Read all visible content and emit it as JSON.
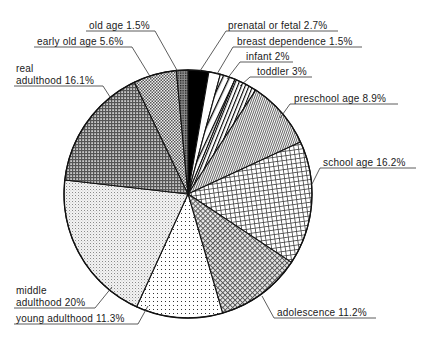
{
  "chart_data": {
    "type": "pie",
    "title": "",
    "start_angle_deg": 0,
    "direction": "clockwise",
    "center": [
      188,
      194
    ],
    "radius": 124,
    "slices": [
      {
        "label": "prenatal or fetal",
        "value": 2.7,
        "display": "prenatal or fetal 2.7%",
        "pattern": "solid-black"
      },
      {
        "label": "breast dependence",
        "value": 1.5,
        "display": "breast dependence 1.5%",
        "pattern": "white"
      },
      {
        "label": "infant",
        "value": 2,
        "display": "infant 2%",
        "pattern": "wide-diagonal-lines"
      },
      {
        "label": "toddler",
        "value": 3,
        "display": "toddler 3%",
        "pattern": "narrow-diagonal-lines"
      },
      {
        "label": "preschool age",
        "value": 8.9,
        "display": "preschool age 8.9%",
        "pattern": "fine-diagonal-hatch"
      },
      {
        "label": "school age",
        "value": 16.2,
        "display": "school age 16.2%",
        "pattern": "square-grid"
      },
      {
        "label": "adolescence",
        "value": 11.2,
        "display": "adolescence 11.2%",
        "pattern": "diagonal-crosshatch"
      },
      {
        "label": "young adulthood",
        "value": 11.3,
        "display": "young adulthood 11.3%",
        "pattern": "sparse-dots"
      },
      {
        "label": "middle adulthood",
        "value": 20,
        "display": [
          "middle",
          "adulthood 20%"
        ],
        "pattern": "light-fine-grid"
      },
      {
        "label": "real adulthood",
        "value": 16.1,
        "display": [
          "real",
          "adulthood 16.1%"
        ],
        "pattern": "dark-dense-grid"
      },
      {
        "label": "early old age",
        "value": 5.6,
        "display": "early old age 5.6%",
        "pattern": "checker-dots"
      },
      {
        "label": "old age",
        "value": 1.5,
        "display": "old age 1.5%",
        "pattern": "dark-dots"
      }
    ],
    "labels": [
      {
        "text": "prenatal or fetal 2.7%",
        "x": 228,
        "y": 29,
        "underline": [
          226,
          338
        ],
        "leader": [
          [
            226,
            31
          ],
          [
            200,
            71
          ]
        ]
      },
      {
        "text": "breast dependence 1.5%",
        "x": 237,
        "y": 45,
        "underline": [
          233,
          362
        ],
        "leader": [
          [
            233,
            47
          ],
          [
            217,
            74
          ]
        ]
      },
      {
        "text": "infant 2%",
        "x": 246,
        "y": 60,
        "underline": [
          240,
          293
        ],
        "leader": [
          [
            240,
            62
          ],
          [
            227,
            79
          ]
        ]
      },
      {
        "text": "toddler 3%",
        "x": 257,
        "y": 75,
        "underline": [
          250,
          312
        ],
        "leader": [
          [
            250,
            77
          ],
          [
            240,
            86
          ]
        ]
      },
      {
        "text": "preschool age 8.9%",
        "x": 294,
        "y": 102,
        "underline": [
          290,
          398
        ],
        "leader": [
          [
            290,
            104
          ],
          [
            280,
            118
          ]
        ]
      },
      {
        "text": "school age 16.2%",
        "x": 323,
        "y": 166,
        "underline": [
          320,
          416
        ],
        "leader": [
          [
            320,
            168
          ],
          [
            312,
            184
          ]
        ]
      },
      {
        "text": "adolescence 11.2%",
        "x": 277,
        "y": 316,
        "underline": [
          274,
          376
        ],
        "leader": [
          [
            274,
            318
          ],
          [
            262,
            296
          ]
        ]
      },
      {
        "text": "young adulthood 11.3%",
        "x": 16,
        "y": 322,
        "underline": [
          14,
          138
        ],
        "leader": [
          [
            138,
            324
          ],
          [
            148,
            306
          ]
        ]
      },
      {
        "text": "middle",
        "x": 16,
        "y": 294
      },
      {
        "text": "adulthood 20%",
        "x": 16,
        "y": 306,
        "underline": [
          14,
          95
        ],
        "leader": [
          [
            95,
            308
          ],
          [
            112,
            287
          ]
        ]
      },
      {
        "text": "real",
        "x": 16,
        "y": 72
      },
      {
        "text": "adulthood 16.1%",
        "x": 16,
        "y": 84,
        "underline": [
          14,
          103
        ],
        "leader": [
          [
            103,
            86
          ],
          [
            112,
            100
          ]
        ]
      },
      {
        "text": "early old age 5.6%",
        "x": 37,
        "y": 45,
        "underline": [
          34,
          132
        ],
        "leader": [
          [
            132,
            47
          ],
          [
            151,
            78
          ]
        ]
      },
      {
        "text": "old age 1.5%",
        "x": 89,
        "y": 29,
        "underline": [
          86,
          155
        ],
        "leader": [
          [
            155,
            31
          ],
          [
            178,
            72
          ]
        ]
      }
    ],
    "xlabel": "",
    "ylabel": "",
    "legend": "none (direct labels with leader lines)",
    "total_percent": 100.0
  }
}
